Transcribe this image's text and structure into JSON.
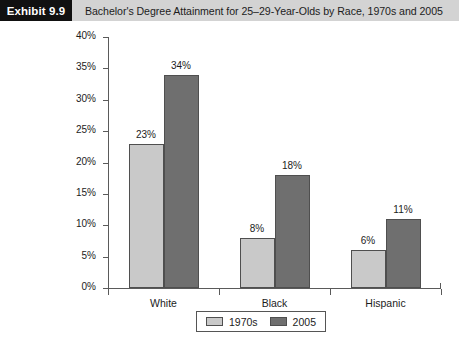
{
  "header": {
    "tag": "Exhibit 9.9",
    "title": "Bachelor's Degree Attainment for 25–29-Year-Olds by Race, 1970s and 2005"
  },
  "colors": {
    "series_1970s": "#c9c9c9",
    "series_2005": "#6f6f6f",
    "axis": "#5a5a5a",
    "header_band": "#d3d3d3",
    "header_tag_bg": "#111111",
    "text": "#1c1c1c"
  },
  "legend": {
    "items": [
      {
        "label": "1970s",
        "color": "#c9c9c9"
      },
      {
        "label": "2005",
        "color": "#6f6f6f"
      }
    ]
  },
  "chart_data": {
    "type": "bar",
    "title": "Bachelor's Degree Attainment for 25–29-Year-Olds by Race, 1970s and 2005",
    "xlabel": "",
    "ylabel": "",
    "categories": [
      "White",
      "Black",
      "Hispanic"
    ],
    "series": [
      {
        "name": "1970s",
        "values": [
          23,
          8,
          6
        ],
        "labels": [
          "23%",
          "8%",
          "6%"
        ]
      },
      {
        "name": "2005",
        "values": [
          34,
          18,
          11
        ],
        "labels": [
          "34%",
          "18%",
          "11%"
        ]
      }
    ],
    "ylim": [
      0,
      40
    ],
    "ytick_values": [
      0,
      5,
      10,
      15,
      20,
      25,
      30,
      35,
      40
    ],
    "ytick_labels": [
      "0%",
      "5%",
      "10%",
      "15%",
      "20%",
      "25%",
      "30%",
      "35%",
      "40%"
    ],
    "grid": false,
    "legend_position": "bottom"
  }
}
